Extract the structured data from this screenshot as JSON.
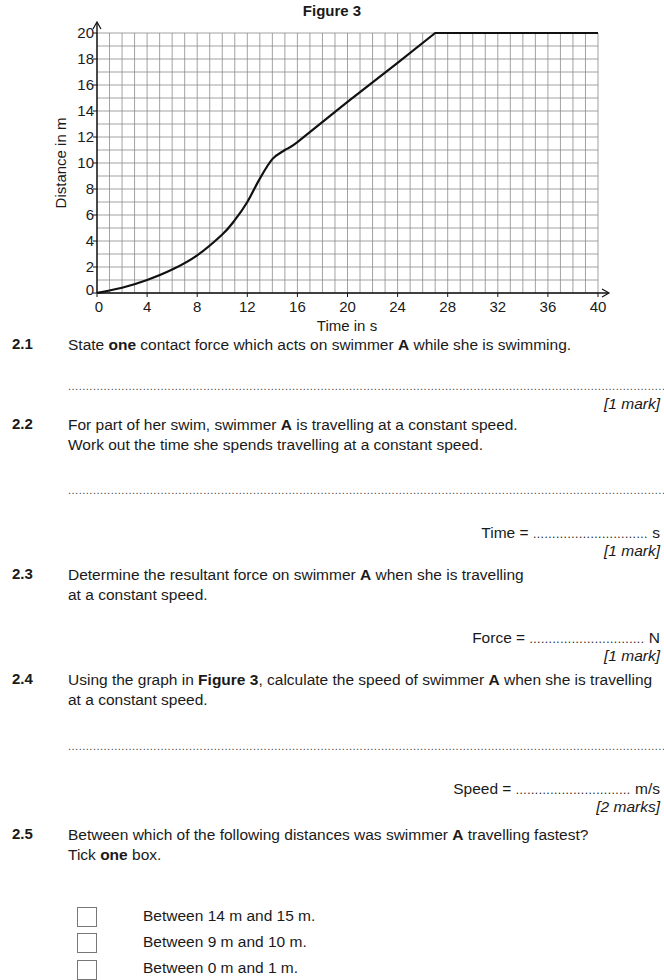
{
  "figure": {
    "title": "Figure 3"
  },
  "chart_data": {
    "type": "line",
    "title": "Figure 3",
    "xlabel": "Time in s",
    "ylabel": "Distance in m",
    "xlim": [
      0,
      40
    ],
    "ylim": [
      0,
      20
    ],
    "x_ticks": [
      0,
      4,
      8,
      12,
      16,
      20,
      24,
      28,
      32,
      36,
      40
    ],
    "y_ticks": [
      0,
      2,
      4,
      6,
      8,
      10,
      12,
      14,
      16,
      18,
      20
    ],
    "grid": true,
    "grid_step": {
      "x": 1,
      "y": 1
    },
    "series": [
      {
        "name": "Swimmer A",
        "x": [
          0,
          2,
          4,
          6,
          8,
          10,
          11,
          12,
          13,
          14,
          15,
          16,
          20,
          24,
          27,
          40
        ],
        "y": [
          0,
          0.4,
          1.0,
          1.8,
          2.9,
          4.5,
          5.6,
          7.0,
          8.8,
          10.3,
          11.0,
          11.6,
          14.7,
          17.7,
          20,
          20
        ]
      }
    ]
  },
  "questions": [
    {
      "num": "2.1",
      "lines": [
        "State <b>one</b> contact force which acts on swimmer <b>A</b> while she is swimming."
      ],
      "mark": "[1 mark]"
    },
    {
      "num": "2.2",
      "lines": [
        "For part of her swim, swimmer <b>A</b> is travelling at a constant speed.",
        "Work out the time she spends travelling at a constant speed."
      ],
      "answer_label": "Time =",
      "answer_unit": "s",
      "mark": "[1 mark]"
    },
    {
      "num": "2.3",
      "lines": [
        "Determine the resultant force on swimmer <b>A</b> when she is travelling",
        "at a constant speed."
      ],
      "answer_label": "Force =",
      "answer_unit": "N",
      "mark": "[1 mark]"
    },
    {
      "num": "2.4",
      "lines": [
        "Using the graph in <b>Figure 3</b>, calculate the speed of swimmer <b>A</b> when she is travelling",
        "at a constant speed."
      ],
      "answer_label": "Speed =",
      "answer_unit": "m/s",
      "mark": "[2 marks]"
    },
    {
      "num": "2.5",
      "lines": [
        "Between which of the following distances was swimmer <b>A</b> travelling fastest?",
        "Tick <b>one</b> box."
      ]
    }
  ],
  "options": [
    "Between 14 m and 15 m.",
    "Between 9 m and 10 m.",
    "Between 0 m and 1 m."
  ]
}
